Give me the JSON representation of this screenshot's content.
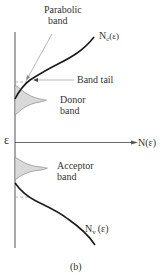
{
  "figure": {
    "caption": "(b)",
    "labels": {
      "parabolic_band_line1": "Parabolic",
      "parabolic_band_line2": "band",
      "nc_main": "N",
      "nc_sub": "c",
      "nc_arg": "(ε)",
      "band_tail": "Band tail",
      "donor_line1": "Donor",
      "donor_line2": "band",
      "energy_axis": "ε",
      "dos_axis": "N(ε)",
      "acceptor_line1": "Acceptor",
      "acceptor_line2": "band",
      "nv_main": "N",
      "nv_sub": "v",
      "nv_arg": "(ε)"
    },
    "colors": {
      "curve": "#1a1a1a",
      "axis": "#555555",
      "band_fill": "#d9d9d9",
      "pointer": "#888888"
    }
  }
}
